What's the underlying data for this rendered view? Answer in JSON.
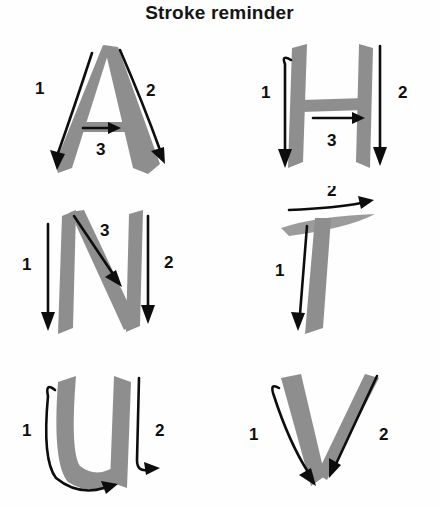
{
  "page": {
    "title": "Stroke reminder",
    "background_color": "#fefefe",
    "glyph_color": "#8e8e8e",
    "arrow_color": "#0d0d0d",
    "text_color": "#151515"
  },
  "grid": {
    "columns": 2,
    "rows": 3
  },
  "letters": [
    {
      "letter": "A",
      "stroke_count": 3,
      "strokes": [
        {
          "number": "1",
          "description": "left diagonal downward from apex to bottom-left",
          "direction": "down-left"
        },
        {
          "number": "2",
          "description": "right diagonal downward from apex to bottom-right",
          "direction": "down-right"
        },
        {
          "number": "3",
          "description": "horizontal crossbar left to right",
          "direction": "right"
        }
      ]
    },
    {
      "letter": "H",
      "stroke_count": 3,
      "strokes": [
        {
          "number": "1",
          "description": "left vertical stem downward",
          "direction": "down"
        },
        {
          "number": "2",
          "description": "right vertical stem downward",
          "direction": "down"
        },
        {
          "number": "3",
          "description": "horizontal crossbar left to right",
          "direction": "right"
        }
      ]
    },
    {
      "letter": "N",
      "stroke_count": 3,
      "strokes": [
        {
          "number": "1",
          "description": "left vertical stem downward",
          "direction": "down"
        },
        {
          "number": "2",
          "description": "right vertical stem downward",
          "direction": "down"
        },
        {
          "number": "3",
          "description": "diagonal from top-left to bottom-right",
          "direction": "down-right"
        }
      ]
    },
    {
      "letter": "T",
      "stroke_count": 2,
      "strokes": [
        {
          "number": "1",
          "description": "vertical stem downward",
          "direction": "down"
        },
        {
          "number": "2",
          "description": "horizontal top bar left to right",
          "direction": "right"
        }
      ]
    },
    {
      "letter": "U",
      "stroke_count": 2,
      "strokes": [
        {
          "number": "1",
          "description": "down the left side and curving around the bottom to the right",
          "direction": "down-then-right"
        },
        {
          "number": "2",
          "description": "right vertical stem downward with small hook",
          "direction": "down"
        }
      ]
    },
    {
      "letter": "V",
      "stroke_count": 2,
      "strokes": [
        {
          "number": "1",
          "description": "left diagonal downward to bottom vertex",
          "direction": "down"
        },
        {
          "number": "2",
          "description": "right diagonal downward from top-right to bottom vertex",
          "direction": "down-left"
        }
      ]
    }
  ]
}
